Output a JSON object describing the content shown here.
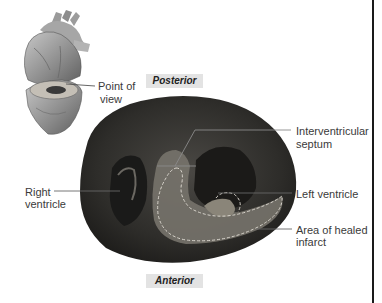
{
  "figure": {
    "orientation": {
      "top": "Posterior",
      "bottom": "Anterior"
    },
    "inset": {
      "description": "heart-illustration",
      "label_line1": "Point of",
      "label_line2": "view"
    },
    "labels": {
      "right_ventricle_line1": "Right",
      "right_ventricle_line2": "ventricle",
      "septum_line1": "Interventricular",
      "septum_line2": "septum",
      "left_ventricle": "Left ventricle",
      "infarct_line1": "Area of healed",
      "infarct_line2": "infarct"
    },
    "colors": {
      "specimen_dark": "#2b2a28",
      "specimen_mid": "#5a5752",
      "infarct_area": "#77736c",
      "orientation_bg": "#e3e3e3",
      "border": "#1a1a1a"
    }
  }
}
